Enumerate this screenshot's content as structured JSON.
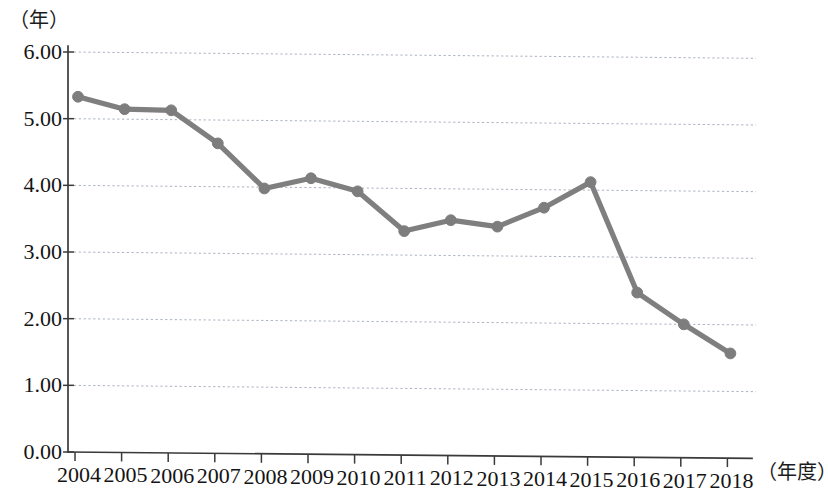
{
  "chart_data": {
    "type": "line",
    "title": "",
    "subtitle": "",
    "xlabel": "（年度）",
    "ylabel": "（年）",
    "categories": [
      "2004",
      "2005",
      "2006",
      "2007",
      "2008",
      "2009",
      "2010",
      "2011",
      "2012",
      "2013",
      "2014",
      "2015",
      "2016",
      "2017",
      "2018"
    ],
    "values": [
      5.33,
      5.15,
      5.14,
      4.65,
      3.98,
      4.14,
      3.95,
      3.36,
      3.53,
      3.44,
      3.73,
      4.12,
      2.47,
      2.0,
      1.57
    ],
    "series": [
      {
        "name": "",
        "values": [
          5.33,
          5.15,
          5.14,
          4.65,
          3.98,
          4.14,
          3.95,
          3.36,
          3.53,
          3.44,
          3.73,
          4.12,
          2.47,
          2.0,
          1.57
        ]
      }
    ],
    "ylim": [
      0.0,
      6.0
    ],
    "ytick_labels": [
      "0.00",
      "1.00",
      "2.00",
      "3.00",
      "4.00",
      "5.00",
      "6.00"
    ],
    "ytick_values": [
      0,
      1,
      2,
      3,
      4,
      5,
      6
    ],
    "xtick_labels": [
      "2004",
      "2005",
      "2006",
      "2007",
      "2008",
      "2009",
      "2010",
      "2011",
      "2012",
      "2013",
      "2014",
      "2015",
      "2016",
      "2017",
      "2018"
    ],
    "grid": true,
    "grid_style": "dotted-horizontal",
    "legend": false,
    "legend_position": "none",
    "line_color": "#7f7f7f",
    "marker": "circle",
    "marker_color": "#7d7d7d",
    "axis_color": "#3a3a3a",
    "gridline_color": "#9aa4b5",
    "background_color": "#ffffff"
  },
  "axes": {
    "y_unit_caption": "（年）",
    "x_unit_caption": "（年度）"
  }
}
